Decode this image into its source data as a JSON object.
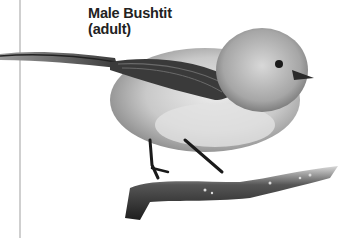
{
  "caption": {
    "line1": "Male Bushtit",
    "line2": "(adult)"
  },
  "image": {
    "subject": "bird-on-branch",
    "species": "Bushtit",
    "palette": [
      "#ffffff",
      "#222222",
      "#7a7a7a",
      "#bdbdbd",
      "#e6e6e6"
    ]
  }
}
